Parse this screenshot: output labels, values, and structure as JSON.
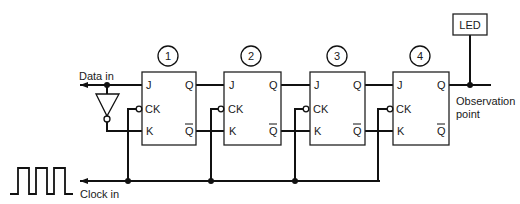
{
  "diagram": {
    "type": "4-stage JK flip-flop shift register",
    "colors": {
      "line": "#111111",
      "background": "#ffffff"
    },
    "inputs": {
      "data_in": "Data in",
      "clock_in": "Clock in"
    },
    "output": {
      "led_label": "LED",
      "observation_line1": "Observation",
      "observation_line2": "point"
    },
    "flip_flops": [
      {
        "number": "1",
        "pins": {
          "j": "J",
          "ck": "CK",
          "k": "K",
          "q": "Q",
          "qbar": "Q"
        }
      },
      {
        "number": "2",
        "pins": {
          "j": "J",
          "ck": "CK",
          "k": "K",
          "q": "Q",
          "qbar": "Q"
        }
      },
      {
        "number": "3",
        "pins": {
          "j": "J",
          "ck": "CK",
          "k": "K",
          "q": "Q",
          "qbar": "Q"
        }
      },
      {
        "number": "4",
        "pins": {
          "j": "J",
          "ck": "CK",
          "k": "K",
          "q": "Q",
          "qbar": "Q"
        }
      }
    ],
    "gates": [
      {
        "type": "inverter",
        "from": "data_in",
        "to": "ff1.k"
      }
    ]
  }
}
